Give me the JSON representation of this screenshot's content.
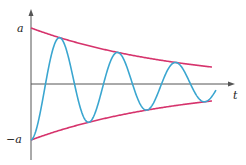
{
  "chart_data": {
    "type": "line",
    "title": "",
    "xlabel": "t",
    "ylabel": "",
    "y_tick_labels": [
      "a",
      "−a"
    ],
    "grid": false,
    "legend": null,
    "series": [
      {
        "name": "upper envelope",
        "color": "#d6336c",
        "formula": "a·e^(−kt)",
        "start": "a",
        "end_approx": "0.3a"
      },
      {
        "name": "lower envelope",
        "color": "#d6336c",
        "formula": "−a·e^(−kt)",
        "start": "−a",
        "end_approx": "−0.3a"
      },
      {
        "name": "damped oscillation",
        "color": "#3aa6d0",
        "formula": "−a·e^(−kt)·cos(ωt)",
        "start": "−a",
        "oscillations_approx": 3.3
      }
    ],
    "colors": {
      "envelope": "#d6336c",
      "oscillation": "#3aa6d0",
      "axes": "#555555"
    }
  },
  "labels": {
    "a": "a",
    "neg_a": "−a",
    "t": "t"
  }
}
